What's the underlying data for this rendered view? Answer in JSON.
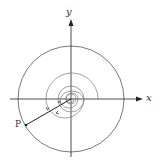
{
  "diagram": {
    "axes": {
      "x_label": "x",
      "y_label": "y"
    },
    "point": {
      "label": "P"
    },
    "colors": {
      "axis": "#222222",
      "circle": "#555555",
      "spiral": "#777777",
      "segment": "#222222"
    }
  }
}
